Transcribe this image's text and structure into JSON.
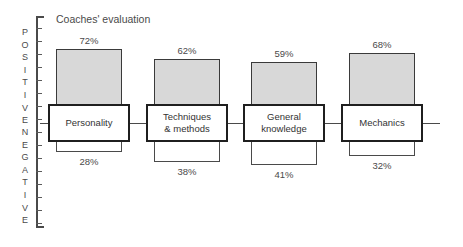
{
  "chart_data": {
    "type": "bar",
    "title": "Coaches' evaluation",
    "subtitle": "",
    "xlabel": "",
    "ylabel": "POSITIVE / NEGATIVE",
    "orientation": "vertical",
    "grid": false,
    "legend": false,
    "baseline": 0,
    "axis": {
      "positive_label": "POSITIVE",
      "negative_label": "NEGATIVE",
      "positive_letters": [
        "P",
        "O",
        "S",
        "I",
        "T",
        "I",
        "V",
        "E"
      ],
      "negative_letters": [
        "N",
        "E",
        "G",
        "A",
        "T",
        "I",
        "V",
        "E"
      ],
      "tick_count_positive": 8,
      "tick_count_negative": 8,
      "ylim": [
        -100,
        100
      ],
      "tick_labels_shown": false
    },
    "categories": [
      "Personality",
      "Techniques\n& methods",
      "General\nknowledge",
      "Mechanics"
    ],
    "series": [
      {
        "name": "Positive",
        "values": [
          72,
          62,
          59,
          68
        ],
        "fill": "crosshatch"
      },
      {
        "name": "Negative",
        "values": [
          28,
          38,
          41,
          32
        ],
        "fill": "white"
      }
    ],
    "value_labels": {
      "positive": [
        "72%",
        "62%",
        "59%",
        "68%"
      ],
      "negative": [
        "28%",
        "38%",
        "41%",
        "32%"
      ]
    },
    "colors": {
      "positive_fill": "#d8d8d8",
      "positive_hatch": "#3c3c3c",
      "negative_fill": "#ffffff",
      "box_border": "#1f1f1f",
      "axis": "#4a4a4a",
      "text": "#4a4a4a",
      "background": "#ffffff"
    }
  }
}
